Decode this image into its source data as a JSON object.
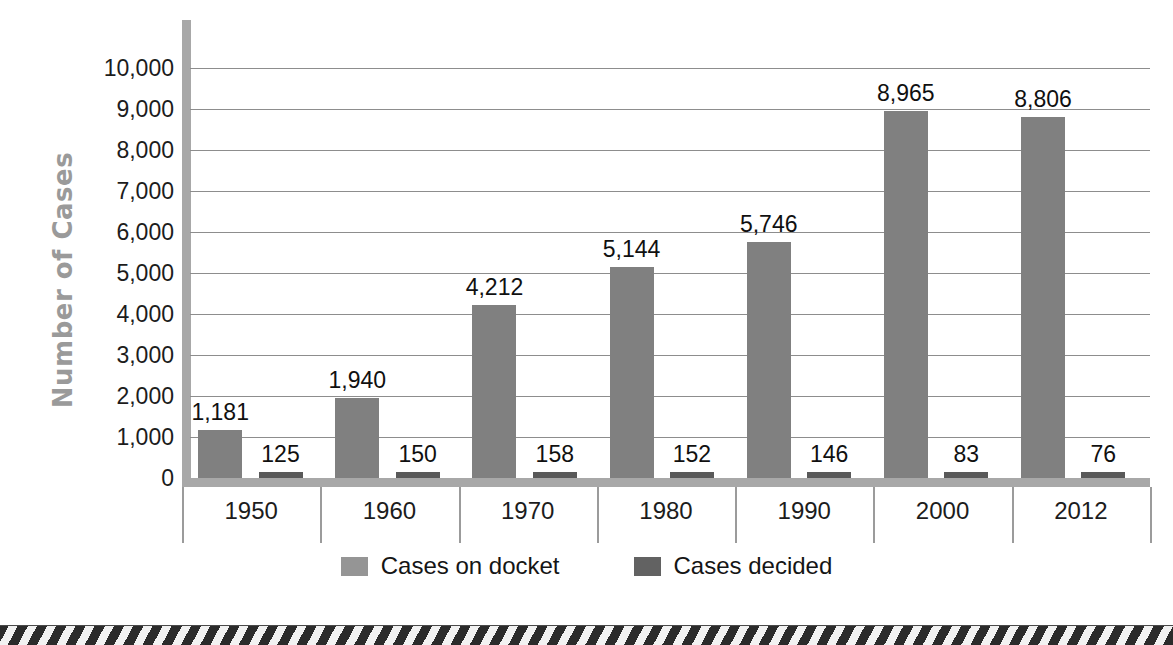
{
  "chart_data": {
    "type": "bar",
    "title": "",
    "xlabel": "",
    "ylabel": "Number of Cases",
    "categories": [
      "1950",
      "1960",
      "1970",
      "1980",
      "1990",
      "2000",
      "2012"
    ],
    "ylim": [
      0,
      10000
    ],
    "ytick_values": [
      0,
      1000,
      2000,
      3000,
      4000,
      5000,
      6000,
      7000,
      8000,
      9000,
      10000
    ],
    "ytick_labels": [
      "0",
      "1,000",
      "2,000",
      "3,000",
      "4,000",
      "5,000",
      "6,000",
      "7,000",
      "8,000",
      "9,000",
      "10,000"
    ],
    "grid": true,
    "legend_position": "bottom",
    "series": [
      {
        "name": "Cases on docket",
        "color": "#808080",
        "values": [
          1181,
          1940,
          4212,
          5144,
          5746,
          8965,
          8806
        ],
        "labels": [
          "1,181",
          "1,940",
          "4,212",
          "5,144",
          "5,746",
          "8,965",
          "8,806"
        ]
      },
      {
        "name": "Cases decided",
        "color": "#595959",
        "values": [
          125,
          150,
          158,
          152,
          146,
          83,
          76
        ],
        "labels": [
          "125",
          "150",
          "158",
          "152",
          "146",
          "83",
          "76"
        ]
      }
    ]
  },
  "axis": {
    "y_title": "Number of Cases"
  },
  "legend": {
    "items": [
      {
        "label": "Cases on docket",
        "color": "#959595"
      },
      {
        "label": "Cases decided",
        "color": "#626262"
      }
    ]
  },
  "colors": {
    "docket": "#808080",
    "decided": "#595959",
    "axis": "#a8a8a8",
    "gridline": "#8d8d8d",
    "y_title": "#9a9a9a",
    "text": "#1c1c1c",
    "hazard_dark": "#2b2b2b",
    "hazard_light": "#f2f2f2"
  }
}
